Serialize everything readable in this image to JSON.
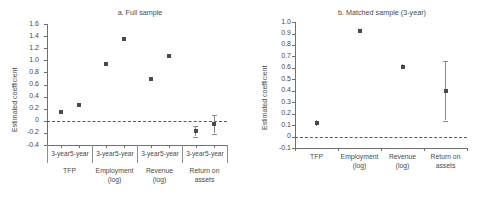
{
  "chart_data": [
    {
      "id": "panel_a",
      "type": "scatter",
      "title": "a. Full sample",
      "xlabel": "",
      "ylabel": "Estimated coefficient",
      "ylim": [
        -0.4,
        1.6
      ],
      "yticks": [
        "1.6",
        "1.4",
        "1.2",
        "1.0",
        "0.8",
        "0.6",
        "0.4",
        "0.2",
        "0",
        "-0.2",
        "-0.4"
      ],
      "ytick_values": [
        1.6,
        1.4,
        1.2,
        1.0,
        0.8,
        0.6,
        0.4,
        0.2,
        0,
        -0.2,
        -0.4
      ],
      "grid": false,
      "zero_reference_line": 0,
      "groups": [
        "TFP",
        "Employment\n(log)",
        "Revenue\n(log)",
        "Return on\nassets"
      ],
      "group_labels": [
        {
          "line1": "TFP",
          "line2": ""
        },
        {
          "line1": "Employment",
          "line2": "(log)"
        },
        {
          "line1": "Revenue",
          "line2": "(log)"
        },
        {
          "line1": "Return on",
          "line2": "assets"
        }
      ],
      "categories": [
        "3-year",
        "5-year",
        "3-year",
        "5-year",
        "3-year",
        "5-year",
        "3-year",
        "5-year"
      ],
      "values": [
        0.14,
        0.27,
        0.94,
        1.36,
        0.69,
        1.08,
        -0.17,
        -0.06
      ],
      "ci_low": [
        0.14,
        0.27,
        0.94,
        1.36,
        0.69,
        1.08,
        -0.26,
        -0.21
      ],
      "ci_high": [
        0.14,
        0.27,
        0.94,
        1.36,
        0.69,
        1.08,
        -0.08,
        0.09
      ]
    },
    {
      "id": "panel_b",
      "type": "scatter",
      "title": "b. Matched sample (3-year)",
      "xlabel": "",
      "ylabel": "Estimated coefficient",
      "ylim": [
        -0.1,
        1.0
      ],
      "yticks": [
        "1.0",
        "0.9",
        "0.8",
        "0.7",
        "0.6",
        "0.5",
        "0.4",
        "0.3",
        "0.2",
        "0.1",
        "0",
        "-0.1"
      ],
      "ytick_values": [
        1.0,
        0.9,
        0.8,
        0.7,
        0.6,
        0.5,
        0.4,
        0.3,
        0.2,
        0.1,
        0,
        -0.1
      ],
      "grid": false,
      "zero_reference_line": 0,
      "categories": [
        "TFP",
        "Employment (log)",
        "Revenue (log)",
        "Return on assets"
      ],
      "category_labels": [
        {
          "line1": "TFP",
          "line2": ""
        },
        {
          "line1": "Employment",
          "line2": "(log)"
        },
        {
          "line1": "Revenue",
          "line2": "(log)"
        },
        {
          "line1": "Return on",
          "line2": "assets"
        }
      ],
      "values": [
        0.12,
        0.92,
        0.61,
        0.4
      ],
      "ci_low": [
        0.095,
        0.905,
        0.585,
        0.14
      ],
      "ci_high": [
        0.145,
        0.935,
        0.635,
        0.66
      ]
    }
  ],
  "style": {
    "marker_color": "#4a4a4a",
    "error_color": "#8a8a8a",
    "axis_color": "#6f6f6f",
    "text_color": "#4a4a4a",
    "background": "#ffffff"
  }
}
